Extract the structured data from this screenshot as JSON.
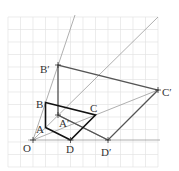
{
  "diagram": {
    "type": "geometry-homothety",
    "grid": {
      "x0": 8,
      "y0": 17,
      "cols": 12,
      "rows": 12,
      "step": 12.5,
      "color": "#e2e2e2"
    },
    "origin_px": {
      "x": 33,
      "y": 140
    },
    "unit_px": 12.5,
    "points": {
      "O": {
        "label": "O",
        "x": 0,
        "y": 0
      },
      "A": {
        "label": "A",
        "x": 1,
        "y": 1
      },
      "B": {
        "label": "B",
        "x": 1,
        "y": 3
      },
      "C": {
        "label": "C",
        "x": 5,
        "y": 2
      },
      "D": {
        "label": "D",
        "x": 3,
        "y": 0
      },
      "A'": {
        "label": "A′",
        "x": 2,
        "y": 2
      },
      "B'": {
        "label": "B′",
        "x": 2,
        "y": 6
      },
      "C'": {
        "label": "C′",
        "x": 10,
        "y": 4
      },
      "D'": {
        "label": "D′",
        "x": 6,
        "y": 0
      }
    },
    "labels": {
      "O": "O",
      "A": "A",
      "B": "B",
      "C": "C",
      "D": "D",
      "A2": "A′",
      "B2": "B′",
      "C2": "C′",
      "D2": "D′"
    },
    "colors": {
      "original_polygon": "#111111",
      "image_polygon": "#555555",
      "rays": "#9a9a9a",
      "axis": "#9a9a9a"
    }
  }
}
